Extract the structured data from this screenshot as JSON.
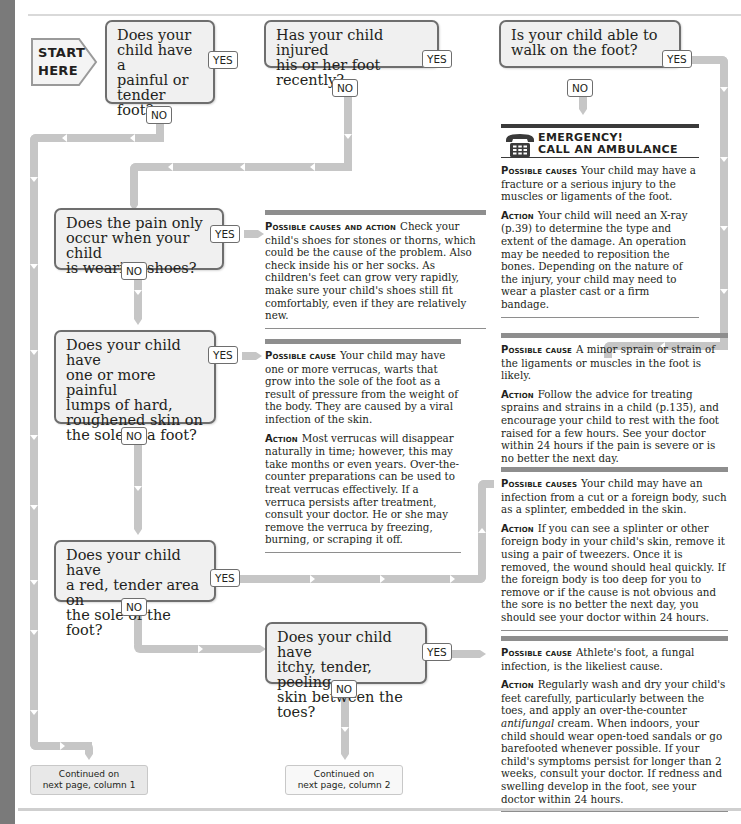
{
  "start": {
    "line1": "START",
    "line2": "HERE"
  },
  "questions": [
    {
      "id": "q1",
      "text": "Does your child have a painful or tender foot?",
      "lines": [
        "Does your",
        "child have a",
        "painful or",
        "tender foot?"
      ],
      "yes": "YES",
      "no": "NO"
    },
    {
      "id": "q2",
      "text": "Has your child injured his or her foot recently?",
      "lines": [
        "Has your child injured",
        "his or her foot recently?"
      ],
      "yes": "YES",
      "no": "NO"
    },
    {
      "id": "q3",
      "text": "Is your child able to walk on the foot?",
      "lines": [
        "Is your child able to",
        "walk on the foot?"
      ],
      "yes": "YES",
      "no": "NO"
    },
    {
      "id": "q4",
      "text": "Does the pain only occur when your child is wearing shoes?",
      "lines": [
        "Does the pain only",
        "occur when your child",
        "is wearing shoes?"
      ],
      "yes": "YES",
      "no": "NO"
    },
    {
      "id": "q5",
      "text": "Does your child have one or more painful lumps of hard, roughened skin on the sole of a foot?",
      "lines": [
        "Does your child have",
        "one or more painful",
        "lumps of hard,",
        "roughened skin on",
        "the sole of a foot?"
      ],
      "yes": "YES",
      "no": "NO"
    },
    {
      "id": "q6",
      "text": "Does your child have a red, tender area on the sole of the foot?",
      "lines": [
        "Does your child have",
        "a red, tender area on",
        "the sole of the foot?"
      ],
      "yes": "YES",
      "no": "NO"
    },
    {
      "id": "q7",
      "text": "Does your child have itchy, tender, peeling skin between the toes?",
      "lines": [
        "Does your child have",
        "itchy, tender, peeling",
        "skin between the toes?"
      ],
      "yes": "YES",
      "no": "NO"
    }
  ],
  "emergency": {
    "icon": "telephone-icon",
    "line1": "EMERGENCY!",
    "line2": "CALL AN AMBULANCE",
    "causes_label": "Possible causes",
    "causes_text": "Your child may have a fracture or a serious injury to the muscles or ligaments of the foot.",
    "action_label": "Action",
    "action_text": "Your child will need an X-ray (p.39) to determine the type and extent of the damage. An operation may be needed to reposition the bones. Depending on the nature of the injury, your child may need to wear a plaster cast or a firm bandage."
  },
  "panels": {
    "sprain": {
      "cause_label": "Possible cause",
      "cause_text": "A minor sprain or strain of the ligaments or muscles in the foot is likely.",
      "action_label": "Action",
      "action_text": "Follow the advice for treating sprains and strains in a child (p.135), and encourage your child to rest with the foot raised for a few hours. See your doctor within 24 hours if the pain is severe or is no better the next day."
    },
    "shoes": {
      "label": "Possible causes and action",
      "text": "Check your child's shoes for stones or thorns, which could be the cause of the problem. Also check inside his or her socks. As children's feet can grow very rapidly, make sure your child's shoes still fit comfortably, even if they are relatively new."
    },
    "verruca": {
      "cause_label": "Possible cause",
      "cause_text": "Your child may have one or more verrucas, warts that grow into the sole of the foot as a result of pressure from the weight of the body. They are caused by a viral infection of the skin.",
      "action_label": "Action",
      "action_text": "Most verrucas will disappear naturally in time; however, this may take months or even years. Over-the-counter preparations can be used to treat verrucas effectively. If a verruca persists after treatment, consult your doctor. He or she may remove the verruca by freezing, burning, or scraping it off."
    },
    "infection": {
      "cause_label": "Possible causes",
      "cause_text": "Your child may have an infection from a cut or a foreign body, such as a splinter, embedded in the skin.",
      "action_label": "Action",
      "action_text": "If you can see a splinter or other foreign body in your child's skin, remove it using a pair of tweezers. Once it is removed, the wound should heal quickly. If the foreign body is too deep for you to remove or if the cause is not obvious and the sore is no better the next day, you should see your doctor within 24 hours."
    },
    "athlete": {
      "cause_label": "Possible cause",
      "cause_text": "Athlete's foot, a fungal infection, is the likeliest cause.",
      "action_label": "Action",
      "action_text_before": "Regularly wash and dry your child's feet carefully, particularly between the toes, and apply an over-the-counter ",
      "action_text_em": "antifungal",
      "action_text_after": " cream. When indoors, your child should wear open-toed sandals or go barefooted whenever possible. If your child's symptoms persist for longer than 2 weeks, consult your doctor. If redness and swelling develop in the foot, see your doctor within 24 hours."
    }
  },
  "continued": [
    {
      "line1": "Continued on",
      "line2": "next page, column 1"
    },
    {
      "line1": "Continued on",
      "line2": "next page, column 2"
    }
  ],
  "colors": {
    "connector": "#c6c6c6",
    "box_fill": "#f0f0f0",
    "box_border": "#6e6e6e",
    "panel_bar": "#8e8e8e",
    "side_bar": "#7a7a7a"
  }
}
